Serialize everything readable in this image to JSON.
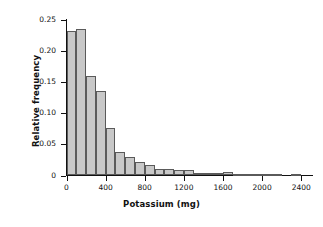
{
  "chart_data": {
    "type": "bar",
    "title": "",
    "subtitle": "",
    "xlabel": "Potassium (mg)",
    "ylabel": "Relative frequency",
    "xlim": [
      -30,
      2500
    ],
    "ylim": [
      0,
      0.25
    ],
    "grid": false,
    "legend": null,
    "bin_width": 100,
    "xticks": [
      0,
      400,
      800,
      1200,
      1600,
      2000,
      2400
    ],
    "xtick_labels": [
      "0",
      "400",
      "800",
      "1200",
      "1600",
      "2000",
      "2400"
    ],
    "yticks": [
      0,
      0.05,
      0.1,
      0.15,
      0.2,
      0.25
    ],
    "ytick_labels": [
      "0",
      "0.05",
      "0.10",
      "0.15",
      "0.20",
      "0.25"
    ],
    "bin_starts": [
      0,
      100,
      200,
      300,
      400,
      500,
      600,
      700,
      800,
      900,
      1000,
      1100,
      1200,
      1300,
      1400,
      1500,
      1600,
      1700,
      1800,
      1900,
      2000,
      2100,
      2300
    ],
    "values": [
      0.232,
      0.235,
      0.16,
      0.135,
      0.076,
      0.038,
      0.03,
      0.021,
      0.017,
      0.01,
      0.011,
      0.009,
      0.009,
      0.004,
      0.004,
      0.004,
      0.005,
      0.001,
      0.001,
      0.002,
      0.002,
      0.002,
      0.002
    ],
    "bar_fill": "#c8c8c8",
    "bar_edge": "#5a5a5a",
    "axis_color": "#111111"
  }
}
